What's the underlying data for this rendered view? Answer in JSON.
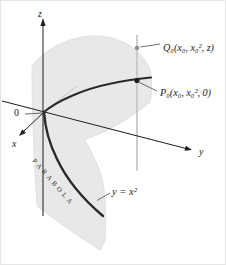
{
  "figure": {
    "labels": {
      "z_axis": "z",
      "y_axis": "y",
      "x_axis": "x",
      "origin": "0",
      "point_q": "Q₀(x₀, x₀², z)",
      "point_p": "P₀(x₀, x₀², 0)",
      "curve_word": "PARABOLA",
      "equation": "y = x²"
    },
    "colors": {
      "background": "#ffffff",
      "surface": "#e8e8e8",
      "surface_edge": "#dadada",
      "curve": "#2a2a2a",
      "axis": "#1e1e1e",
      "vertical_line": "#c8c8c8",
      "crease_line": "#c4c4c4",
      "point_q_dot": "#8f8f8f",
      "point_p_dot": "#1f1f1f",
      "leader": "#4a4a4a"
    }
  }
}
